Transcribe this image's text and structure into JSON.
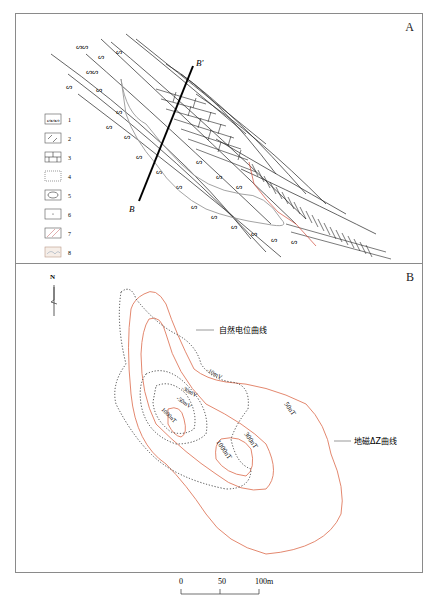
{
  "panel_a": {
    "label": "A",
    "section_line": {
      "start_label": "B",
      "end_label": "B'"
    },
    "legend": [
      {
        "id": 1,
        "label": "1",
        "pattern": "schist-symbol"
      },
      {
        "id": 2,
        "label": "2",
        "pattern": "volcanic-chevron"
      },
      {
        "id": 3,
        "label": "3",
        "pattern": "limestone-brick"
      },
      {
        "id": 4,
        "label": "4",
        "pattern": "dotted-sandstone"
      },
      {
        "id": 5,
        "label": "5",
        "pattern": "lens-orebody"
      },
      {
        "id": 6,
        "label": "6",
        "pattern": "sparse-dot"
      },
      {
        "id": 7,
        "label": "7",
        "pattern": "diagonal-hatch-red"
      },
      {
        "id": 8,
        "label": "8",
        "pattern": "colored-fill"
      }
    ]
  },
  "panel_b": {
    "label": "B",
    "north_arrow": "N",
    "callouts": {
      "self_potential": "自然电位曲线",
      "magnetic": "地磁ΔZ曲线"
    },
    "sp_contours": [
      "-10mV",
      "-30mV",
      "-50mV"
    ],
    "mag_contours": [
      "50nT",
      "300nT",
      "1000nT",
      "1000nT"
    ],
    "colors": {
      "magnetic": "#e07a5f",
      "self_potential": "#333333"
    }
  },
  "scale_bar": {
    "ticks": [
      "0",
      "50",
      "100m"
    ]
  }
}
